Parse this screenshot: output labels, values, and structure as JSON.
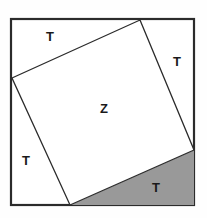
{
  "figure": {
    "canvas": {
      "width": 207,
      "height": 218
    },
    "colors": {
      "background": "#fefefe",
      "outer_square_fill": "#ffffff",
      "inner_square_fill": "#ffffff",
      "shaded_triangle_fill": "#999999",
      "stroke": "#2b2b2b",
      "label_text": "#1a1a1a"
    },
    "outer_square": {
      "name": "outer-square",
      "x": 11,
      "y": 19,
      "width": 183,
      "height": 186,
      "stroke_width": 2.2
    },
    "inner_square": {
      "name": "inner-square",
      "points": "140,20 194,150 70,205 12,78",
      "stroke_width": 1.3
    },
    "shaded_triangle": {
      "name": "shaded-triangle-bottom-right",
      "points": "194,150 194,205 70,205"
    },
    "labels": [
      {
        "id": "t-top",
        "text": "T",
        "x": 50,
        "y": 38,
        "region": "top-triangle"
      },
      {
        "id": "t-right",
        "text": "T",
        "x": 177,
        "y": 63,
        "region": "right-triangle"
      },
      {
        "id": "z-center",
        "text": "Z",
        "x": 104,
        "y": 110,
        "region": "inner-square"
      },
      {
        "id": "t-left",
        "text": "T",
        "x": 26,
        "y": 162,
        "region": "left-triangle"
      },
      {
        "id": "t-bottom",
        "text": "T",
        "x": 156,
        "y": 189,
        "region": "shaded-triangle"
      }
    ]
  }
}
